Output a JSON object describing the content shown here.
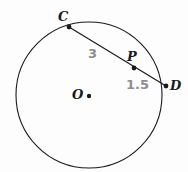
{
  "figure": {
    "type": "circle-with-chord",
    "background_color": "#fdfdfd",
    "stroke_color": "#1a1a1a",
    "measure_text_color": "#8e8e8e",
    "width": 188,
    "height": 172
  },
  "circle": {
    "name": "circle-O",
    "center_label": "O",
    "center_x": 89,
    "center_y": 95,
    "radius": 73
  },
  "points": [
    {
      "id": "C",
      "label": "C",
      "x": 69,
      "y": 27,
      "on_circle": true
    },
    {
      "id": "P",
      "label": "P",
      "x": 134,
      "y": 68,
      "on_circle": false
    },
    {
      "id": "D",
      "label": "D",
      "x": 166,
      "y": 86,
      "on_circle": true
    },
    {
      "id": "O",
      "label": "O",
      "x": 89,
      "y": 96,
      "on_circle": false
    }
  ],
  "segments": [
    {
      "id": "CP",
      "from": "C",
      "to": "P",
      "length_label": "3"
    },
    {
      "id": "PD",
      "from": "P",
      "to": "D",
      "length_label": "1.5"
    }
  ],
  "measures": {
    "cp": "3",
    "pd": "1.5"
  }
}
